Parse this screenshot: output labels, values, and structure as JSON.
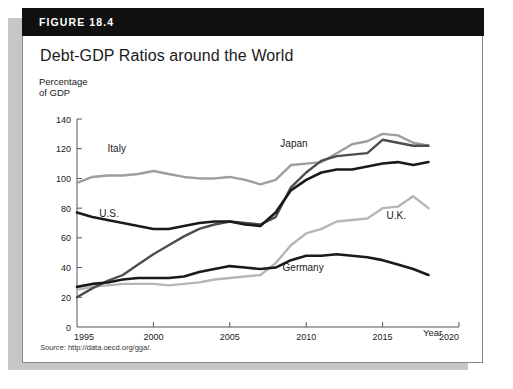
{
  "figure": {
    "banner_label": "FIGURE 18.4",
    "title": "Debt-GDP Ratios around the World",
    "source_prefix": "Source:",
    "source_url": "http://data.oecd.org/gga/."
  },
  "axes": {
    "y_title": "Percentage\nof GDP",
    "x_title": "Year",
    "y_ticks": [
      "0",
      "20",
      "40",
      "60",
      "80",
      "100",
      "120",
      "140"
    ],
    "x_ticks": [
      "1995",
      "2000",
      "2005",
      "2010",
      "2015",
      "2020"
    ]
  },
  "colors": {
    "us_black": "#1a1a1a",
    "germany_black": "#1a1a1a",
    "japan_dark_gray": "#4d4d4d",
    "italy_gray": "#9e9e9e",
    "uk_gray": "#b5b5b5",
    "banner": "#111111",
    "card_border": "#8a8a8a",
    "shadow": "#c6c6c6"
  },
  "chart_data": {
    "type": "line",
    "title": "Debt-GDP Ratios around the World",
    "xlabel": "Year",
    "ylabel": "Percentage of GDP",
    "xlim": [
      1995,
      2020
    ],
    "ylim": [
      0,
      140
    ],
    "grid": false,
    "legend": "inline-labels",
    "x": [
      1995,
      1996,
      1997,
      1998,
      1999,
      2000,
      2001,
      2002,
      2003,
      2004,
      2005,
      2006,
      2007,
      2008,
      2009,
      2010,
      2011,
      2012,
      2013,
      2014,
      2015,
      2016,
      2017,
      2018
    ],
    "series": [
      {
        "name": "Italy",
        "color": "#9e9e9e",
        "label_x": 1997.6,
        "label_y": 118,
        "values": [
          97,
          101,
          102,
          102,
          103,
          105,
          103,
          101,
          100,
          100,
          101,
          99,
          96,
          99,
          109,
          110,
          111,
          117,
          123,
          125,
          130,
          129,
          124,
          122
        ]
      },
      {
        "name": "U.S.",
        "color": "#1a1a1a",
        "label_x": 1997.1,
        "label_y": 74,
        "values": [
          77,
          74,
          72,
          70,
          68,
          66,
          66,
          68,
          70,
          71,
          71,
          69,
          68,
          77,
          92,
          99,
          104,
          106,
          106,
          108,
          110,
          111,
          109,
          111
        ]
      },
      {
        "name": "Japan",
        "color": "#4d4d4d",
        "label_x": 2009.2,
        "label_y": 121,
        "values": [
          20,
          26,
          31,
          35,
          42,
          49,
          55,
          61,
          66,
          69,
          71,
          70,
          69,
          74,
          94,
          104,
          112,
          115,
          116,
          117,
          126,
          124,
          122,
          122
        ]
      },
      {
        "name": "Germany",
        "color": "#1a1a1a",
        "label_x": 2009.8,
        "label_y": 38,
        "values": [
          27,
          29,
          30,
          32,
          33,
          33,
          33,
          34,
          37,
          39,
          41,
          40,
          39,
          40,
          45,
          48,
          48,
          49,
          48,
          47,
          45,
          42,
          39,
          35
        ]
      },
      {
        "name": "U.K.",
        "color": "#b5b5b5",
        "label_x": 2015.9,
        "label_y": 73,
        "values": [
          25,
          27,
          28,
          29,
          29,
          29,
          28,
          29,
          30,
          32,
          33,
          34,
          35,
          43,
          55,
          63,
          66,
          71,
          72,
          73,
          80,
          81,
          88,
          80
        ]
      }
    ]
  }
}
